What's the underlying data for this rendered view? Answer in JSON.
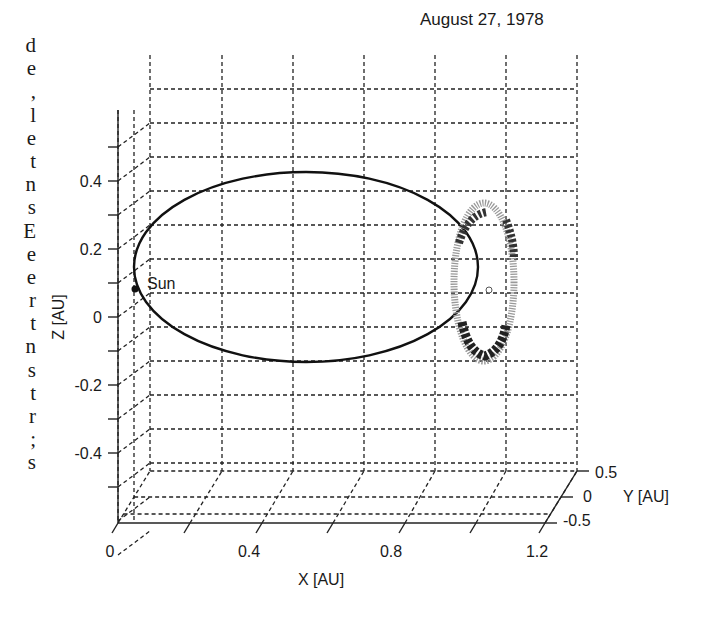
{
  "margin_fragments": [
    "d",
    "e",
    ",",
    "l",
    "e",
    "t",
    "n",
    "s",
    "E",
    "e",
    "e",
    "r",
    "t",
    "n",
    "s",
    "t",
    "r",
    ";",
    "s"
  ],
  "chart_data": {
    "type": "line",
    "projection": "3d",
    "title": "August 27, 1978",
    "xlabel": "X [AU]",
    "ylabel": "Y [AU]",
    "zlabel": "Z [AU]",
    "x_ticks": [
      "0",
      "0.4",
      "0.8",
      "1.2"
    ],
    "y_ticks": [
      "0.5",
      "0",
      "-0.5"
    ],
    "z_ticks": [
      "0.4",
      "0.2",
      "0",
      "-0.2",
      "-0.4"
    ],
    "xlim": [
      0,
      1.2
    ],
    "ylim": [
      -0.5,
      0.5
    ],
    "zlim": [
      -0.6,
      0.6
    ],
    "grid": true,
    "annotations": [
      {
        "text": "Sun",
        "x": 0,
        "y": 0,
        "z": 0
      }
    ],
    "series": [
      {
        "name": "Earth orbit",
        "style": "solid black line",
        "shape": "ellipse",
        "center_x": 0.5,
        "semi_major_x": 1.0,
        "z_extent": [
          -0.14,
          0.44
        ]
      },
      {
        "name": "Spacecraft halo orbit around L1",
        "style": "shaded band",
        "center": {
          "x": 0.99,
          "y": 0,
          "z": 0
        },
        "z_extent": [
          -0.14,
          0.29
        ]
      }
    ]
  }
}
